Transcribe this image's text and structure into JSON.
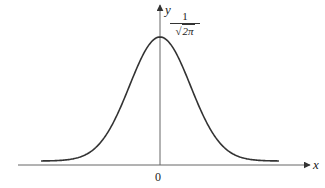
{
  "chart_data": {
    "type": "line",
    "title": "",
    "xlabel": "x",
    "ylabel": "y",
    "x_tick_labels": [
      "0"
    ],
    "peak_label": {
      "numerator": "1",
      "denominator_radicand": "2π",
      "denominator_root": "√"
    },
    "peak": {
      "x": 0,
      "y": "1/√(2π)"
    },
    "series": [
      {
        "name": "normal density",
        "x": [
          -3.9,
          -3,
          -2.5,
          -2,
          -1.5,
          -1,
          -0.5,
          0,
          0.5,
          1,
          1.5,
          2,
          2.5,
          3,
          3.9
        ],
        "values": [
          0.0002,
          0.0044,
          0.0175,
          0.054,
          0.1295,
          0.242,
          0.3521,
          0.3989,
          0.3521,
          0.242,
          0.1295,
          0.054,
          0.0175,
          0.0044,
          0.0002
        ]
      }
    ],
    "xlim": [
      -4.7,
      4.9
    ],
    "grid": false,
    "legend": "none",
    "colors": {
      "curve": "#333333",
      "axis": "#555555"
    }
  },
  "labels": {
    "x_axis": "x",
    "y_axis": "y",
    "origin": "0",
    "peak_numerator": "1",
    "peak_denominator_root": "√",
    "peak_denominator_radicand": "2π"
  }
}
